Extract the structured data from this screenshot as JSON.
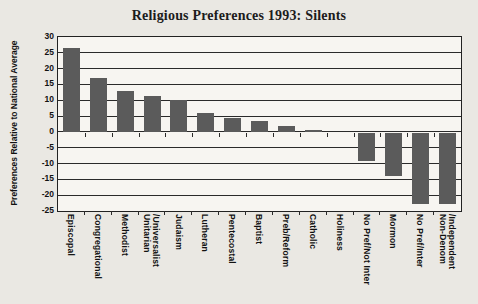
{
  "chart_data": {
    "type": "bar",
    "title": "Religious Preferences 1993: Silents",
    "ylabel": "Preferences Relative to National Average",
    "xlabel": "",
    "ylim": [
      -25,
      30
    ],
    "yticks": [
      30,
      25,
      20,
      15,
      10,
      5,
      0,
      -5,
      -10,
      -15,
      -20,
      -25
    ],
    "grid": true,
    "legend": "none",
    "bar_color": "#5b5b5b",
    "categories": [
      "Episcopal",
      "Congregational",
      "Methodist",
      "Unitarian\n/Universalist",
      "Judaism",
      "Lutheran",
      "Pentecostal",
      "Baptist",
      "Preb/Reform",
      "Catholic",
      "Holiness",
      "No Pref/Not Inter",
      "Mormon",
      "No Pref/Inter",
      "Non-Denom\n/Independent"
    ],
    "values": [
      26.5,
      17,
      13,
      11.5,
      10,
      6,
      4.5,
      3.5,
      2,
      0.5,
      0,
      -9,
      -13.5,
      -22.5,
      -22.5
    ]
  }
}
